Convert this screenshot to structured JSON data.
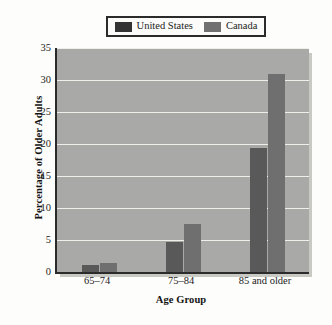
{
  "chart_data": {
    "type": "bar",
    "title": "",
    "xlabel": "Age Group",
    "ylabel": "Percentage of Older Adults",
    "categories": [
      "65–74",
      "75–84",
      "85 and older"
    ],
    "series": [
      {
        "name": "United States",
        "color": "#595959",
        "values": [
          1.1,
          4.7,
          19.3
        ]
      },
      {
        "name": "Canada",
        "color": "#6f6f6f",
        "values": [
          1.4,
          7.5,
          30.9
        ]
      }
    ],
    "ylim": [
      0,
      35
    ],
    "ytick_values": [
      0,
      5,
      10,
      15,
      20,
      25,
      30,
      35
    ],
    "ytick_labels": [
      "0",
      "5",
      "10",
      "15",
      "20",
      "25",
      "30",
      "35"
    ],
    "grid": true,
    "grid_color": "#efefea",
    "legend_position": "top",
    "plot_background": "#a9a9a7",
    "axis_color": "#2b2b2b"
  },
  "legend": {
    "entries": [
      {
        "label": "United States",
        "swatch": "#333333"
      },
      {
        "label": "Canada",
        "swatch": "#707070"
      }
    ]
  }
}
